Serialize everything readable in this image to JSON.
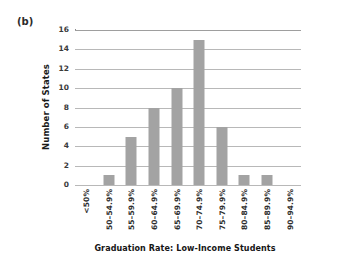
{
  "figure": {
    "panel_label": "(b)",
    "background_color": "#ffffff",
    "bar_color": "#a3a3a3",
    "gridline_color": "#b8b8b8",
    "axis_color": "#8a8a8a",
    "text_color": "#1a1a1a"
  },
  "chart_data": {
    "type": "bar",
    "title": "",
    "subtitle": "",
    "panel": "(b)",
    "categories": [
      "<50%",
      "50–54.9%",
      "55–59.9%",
      "60–64.9%",
      "65–69.9%",
      "70–74.9%",
      "75–79.9%",
      "80–84.9%",
      "85–89.9%",
      "90–94.9%"
    ],
    "values": [
      0,
      1,
      5,
      8,
      10,
      15,
      6,
      1,
      1,
      0
    ],
    "xlabel": "Graduation Rate: Low-Income Students",
    "ylabel": "Number of States",
    "ylim": [
      0,
      16
    ],
    "ytick_labels": [
      "16",
      "14",
      "12",
      "10",
      "8",
      "6",
      "4",
      "2",
      "0"
    ],
    "ytick_values": [
      16,
      14,
      12,
      10,
      8,
      6,
      4,
      2,
      0
    ],
    "ytick_step": 2,
    "grid": "horizontal",
    "legend": "none",
    "bar_orientation": "vertical",
    "xtick_label_rotation": -90
  }
}
